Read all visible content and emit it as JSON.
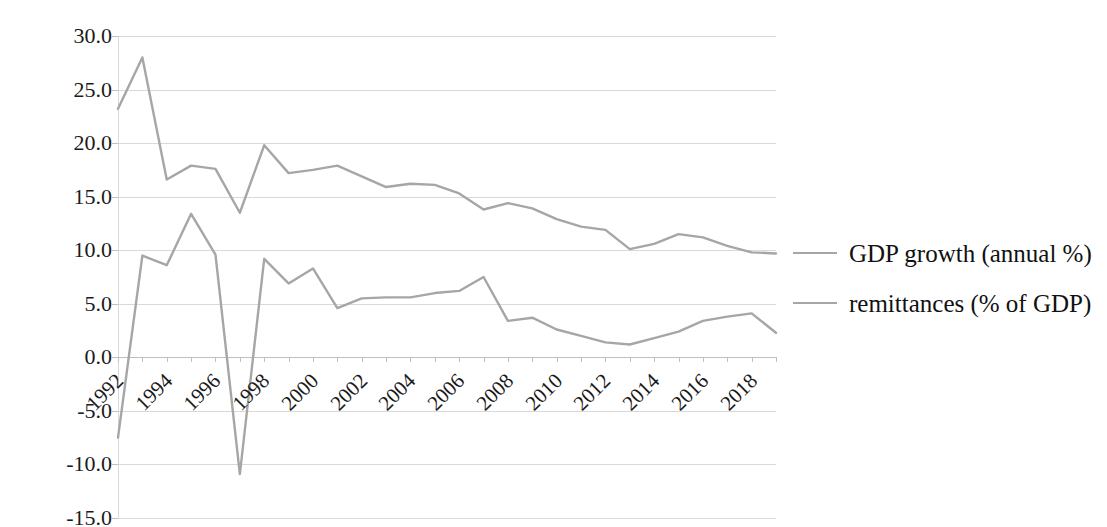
{
  "chart_data": {
    "type": "line",
    "title": "",
    "subtitle": "",
    "xlabel": "",
    "ylabel": "",
    "x": [
      1992,
      1993,
      1994,
      1995,
      1996,
      1997,
      1998,
      1999,
      2000,
      2001,
      2002,
      2003,
      2004,
      2005,
      2006,
      2007,
      2008,
      2009,
      2010,
      2011,
      2012,
      2013,
      2014,
      2015,
      2016,
      2017,
      2018,
      2019
    ],
    "xlim": [
      1992,
      2019
    ],
    "ylim": [
      -15.0,
      30.0
    ],
    "ytick_step": 5.0,
    "xtick_labels": [
      "1992",
      "1994",
      "1996",
      "1998",
      "2000",
      "2002",
      "2004",
      "2006",
      "2008",
      "2010",
      "2012",
      "2014",
      "2016",
      "2018"
    ],
    "xtick_label_rotation_deg": -45,
    "ytick_labels": [
      "30.0",
      "25.0",
      "20.0",
      "15.0",
      "10.0",
      "5.0",
      "0.0",
      "-5.0",
      "-10.0",
      "-15.0"
    ],
    "grid": "horizontal",
    "legend_position": "right",
    "background_color": "#ffffff",
    "series": [
      {
        "name": "GDP growth (annual %)",
        "color": "#a6a6a6",
        "values": [
          23.2,
          28.0,
          16.6,
          17.9,
          17.6,
          13.5,
          19.8,
          17.2,
          17.5,
          17.9,
          16.9,
          15.9,
          16.2,
          16.1,
          15.3,
          13.8,
          14.4,
          13.9,
          12.9,
          12.2,
          11.9,
          10.1,
          10.6,
          11.5,
          11.2,
          10.4,
          9.8,
          9.7
        ]
      },
      {
        "name": "remittances (% of GDP)",
        "color": "#a6a6a6",
        "values": [
          -7.5,
          9.5,
          8.6,
          13.4,
          9.6,
          -10.9,
          9.2,
          6.9,
          8.3,
          4.6,
          5.5,
          5.6,
          5.6,
          6.0,
          6.2,
          7.5,
          3.4,
          3.7,
          2.6,
          2.0,
          1.4,
          1.2,
          1.8,
          2.4,
          3.4,
          3.8,
          4.1,
          2.3
        ]
      }
    ]
  },
  "legend": {
    "entries": [
      {
        "label": "GDP growth (annual %)"
      },
      {
        "label": "remittances (% of GDP)"
      }
    ]
  }
}
